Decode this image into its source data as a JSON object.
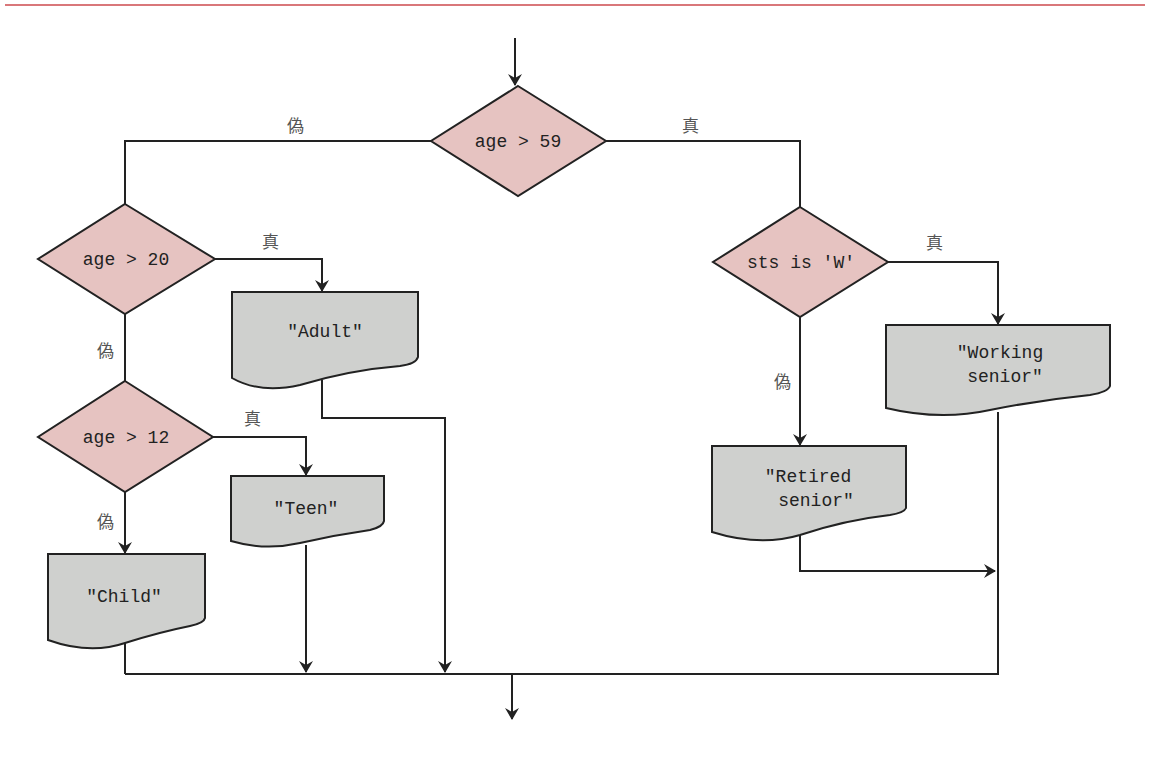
{
  "diagram": {
    "type": "flowchart",
    "colors": {
      "decision_fill": "#e6c3c1",
      "output_fill": "#cfd0ce",
      "top_rule": "#d9777a",
      "line": "#222222"
    },
    "decisions": [
      {
        "id": "d1",
        "label": "age > 59"
      },
      {
        "id": "d2",
        "label": "age > 20"
      },
      {
        "id": "d3",
        "label": "age > 12"
      },
      {
        "id": "d4",
        "label": "sts is 'W'"
      }
    ],
    "outputs": [
      {
        "id": "o_adult",
        "lines": [
          "\"Adult\""
        ]
      },
      {
        "id": "o_teen",
        "lines": [
          "\"Teen\""
        ]
      },
      {
        "id": "o_child",
        "lines": [
          "\"Child\""
        ]
      },
      {
        "id": "o_working",
        "lines": [
          "\"Working",
          "senior\""
        ]
      },
      {
        "id": "o_retired",
        "lines": [
          "\"Retired",
          "senior\""
        ]
      }
    ],
    "edge_labels": {
      "d1_false": "偽",
      "d1_true": "真",
      "d2_true": "真",
      "d2_false": "偽",
      "d3_true": "真",
      "d3_false": "偽",
      "d4_true": "真",
      "d4_false": "偽"
    },
    "edges": [
      {
        "from": "start",
        "to": "d1"
      },
      {
        "from": "d1",
        "to": "d2",
        "label": "偽"
      },
      {
        "from": "d1",
        "to": "d4",
        "label": "真"
      },
      {
        "from": "d2",
        "to": "o_adult",
        "label": "真"
      },
      {
        "from": "d2",
        "to": "d3",
        "label": "偽"
      },
      {
        "from": "d3",
        "to": "o_teen",
        "label": "真"
      },
      {
        "from": "d3",
        "to": "o_child",
        "label": "偽"
      },
      {
        "from": "d4",
        "to": "o_working",
        "label": "真"
      },
      {
        "from": "d4",
        "to": "o_retired",
        "label": "偽"
      },
      {
        "from": "o_adult",
        "to": "end"
      },
      {
        "from": "o_teen",
        "to": "end"
      },
      {
        "from": "o_child",
        "to": "end"
      },
      {
        "from": "o_working",
        "to": "end"
      },
      {
        "from": "o_retired",
        "to": "end"
      }
    ]
  }
}
